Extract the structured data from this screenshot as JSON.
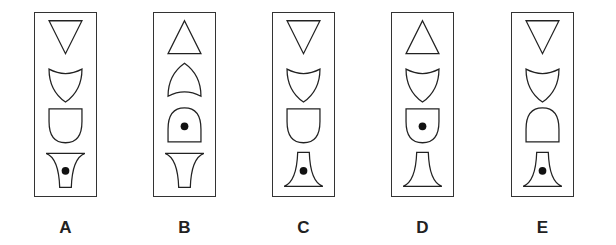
{
  "question": {
    "type": "figure-sequence-odd-one-out",
    "options": [
      {
        "label": "A",
        "shapes": [
          "triangle-down",
          "shield-down",
          "cup-down",
          "flare-up-dot"
        ],
        "dot_position": 4
      },
      {
        "label": "B",
        "shapes": [
          "triangle-up",
          "shield-up",
          "cup-up-dot",
          "flare-up"
        ],
        "dot_position": 3
      },
      {
        "label": "C",
        "shapes": [
          "triangle-down",
          "shield-down",
          "cup-down",
          "flare-down-dot"
        ],
        "dot_position": 4
      },
      {
        "label": "D",
        "shapes": [
          "triangle-up",
          "shield-down",
          "cup-down-dot",
          "flare-down"
        ],
        "dot_position": 3
      },
      {
        "label": "E",
        "shapes": [
          "triangle-down",
          "shield-down",
          "cup-up",
          "flare-down-dot"
        ],
        "dot_position": 4
      }
    ]
  },
  "colors": {
    "stroke": "#222222",
    "dot": "#111111",
    "border": "#333333"
  }
}
